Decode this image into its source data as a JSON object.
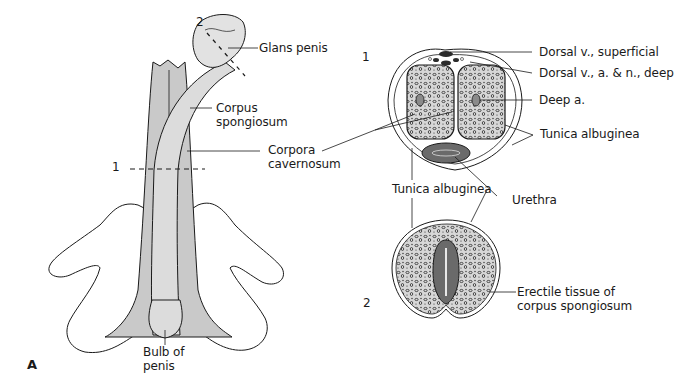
{
  "figure": {
    "panel_letter": "A",
    "colors": {
      "background": "#ffffff",
      "outline": "#1a1a1a",
      "cavernosum_fill": "#c9c9c9",
      "spongiosum_fill": "#dcdcdc",
      "glans_fill": "#e2e2e2",
      "crura_fill": "#ffffff",
      "erectile_fill": "#d7d7d7",
      "erectile_texture": "#2b2b2b",
      "urethra_fill": "#6a6a6a"
    },
    "side_view": {
      "section_markers": {
        "section_1": "1",
        "section_2": "2"
      },
      "labels": {
        "glans_penis": "Glans penis",
        "corpus_spongiosum_line1": "Corpus",
        "corpus_spongiosum_line2": "spongiosum",
        "corpora_cavernosum_line1": "Corpora",
        "corpora_cavernosum_line2": "cavernosum",
        "bulb_line1": "Bulb of",
        "bulb_line2": "penis"
      }
    },
    "cross_section_1": {
      "number": "1",
      "labels": {
        "dorsal_superficial": "Dorsal v., superficial",
        "dorsal_deep": "Dorsal v., a. & n., deep",
        "deep_artery": "Deep a.",
        "tunica_albuginea_right": "Tunica albuginea",
        "tunica_albuginea_shared": "Tunica albuginea",
        "urethra": "Urethra"
      }
    },
    "cross_section_2": {
      "number": "2",
      "labels": {
        "erectile_line1": "Erectile tissue of",
        "erectile_line2": "corpus spongiosum"
      }
    }
  }
}
